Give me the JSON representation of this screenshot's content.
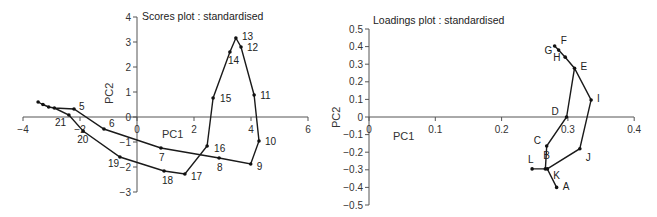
{
  "chart_data": [
    {
      "type": "line",
      "title": "Scores plot : standardised",
      "xlabel": "PC1",
      "ylabel": "PC2",
      "xlim": [
        -4,
        6
      ],
      "ylim": [
        -3,
        4
      ],
      "xticks": [
        -4,
        -2,
        0,
        2,
        4,
        6
      ],
      "yticks": [
        -3,
        -2,
        -1,
        0,
        1,
        2,
        3,
        4
      ],
      "grid": false,
      "series": [
        {
          "name": "scores",
          "points": [
            {
              "label": "1",
              "x": -3.47,
              "y": 0.6,
              "show_label": false
            },
            {
              "label": "2",
              "x": -3.3,
              "y": 0.5,
              "show_label": false
            },
            {
              "label": "3",
              "x": -3.1,
              "y": 0.4,
              "show_label": false
            },
            {
              "label": "4",
              "x": -2.9,
              "y": 0.36,
              "show_label": false
            },
            {
              "label": "5",
              "x": -2.21,
              "y": 0.32,
              "show_label": true
            },
            {
              "label": "6",
              "x": -1.16,
              "y": -0.48,
              "show_label": true
            },
            {
              "label": "7",
              "x": 0.84,
              "y": -1.24,
              "show_label": true
            },
            {
              "label": "8",
              "x": 2.88,
              "y": -1.64,
              "show_label": true
            },
            {
              "label": "9",
              "x": 3.99,
              "y": -1.88,
              "show_label": true
            },
            {
              "label": "10",
              "x": 4.28,
              "y": -0.96,
              "show_label": true
            },
            {
              "label": "11",
              "x": 4.11,
              "y": 0.88,
              "show_label": true
            },
            {
              "label": "12",
              "x": 3.65,
              "y": 2.8,
              "show_label": true
            },
            {
              "label": "13",
              "x": 3.47,
              "y": 3.16,
              "show_label": true
            },
            {
              "label": "14",
              "x": 3.26,
              "y": 2.6,
              "show_label": true
            },
            {
              "label": "15",
              "x": 2.67,
              "y": 0.76,
              "show_label": true
            },
            {
              "label": "16",
              "x": 2.46,
              "y": -1.16,
              "show_label": true
            },
            {
              "label": "17",
              "x": 1.68,
              "y": -2.28,
              "show_label": true
            },
            {
              "label": "18",
              "x": 0.95,
              "y": -2.16,
              "show_label": true
            },
            {
              "label": "19",
              "x": -0.6,
              "y": -1.6,
              "show_label": true
            },
            {
              "label": "20",
              "x": -1.89,
              "y": -0.56,
              "show_label": true
            },
            {
              "label": "21",
              "x": -2.39,
              "y": 0.08,
              "show_label": true
            }
          ]
        }
      ]
    },
    {
      "type": "line",
      "title": "Loadings plot : standardised",
      "xlabel": "PC1",
      "ylabel": "PC2",
      "xlim": [
        0,
        0.4
      ],
      "ylim": [
        -0.5,
        0.5
      ],
      "xticks": [
        0,
        0.1,
        0.2,
        0.3,
        0.4
      ],
      "yticks": [
        -0.5,
        -0.4,
        -0.3,
        -0.2,
        -0.1,
        0,
        0.1,
        0.2,
        0.3,
        0.4,
        0.5
      ],
      "grid": false,
      "series": [
        {
          "name": "loadings",
          "path_order": [
            "A",
            "K",
            "L",
            "K",
            "B",
            "C",
            "D",
            "E",
            "H",
            "G",
            "F",
            "G",
            "H",
            "E",
            "I",
            "J",
            "K"
          ],
          "points": [
            {
              "label": "A",
              "x": 0.283,
              "y": -0.4
            },
            {
              "label": "B",
              "x": 0.266,
              "y": -0.295
            },
            {
              "label": "C",
              "x": 0.268,
              "y": -0.165
            },
            {
              "label": "D",
              "x": 0.298,
              "y": 0.0
            },
            {
              "label": "E",
              "x": 0.31,
              "y": 0.277
            },
            {
              "label": "F",
              "x": 0.28,
              "y": 0.403
            },
            {
              "label": "G",
              "x": 0.286,
              "y": 0.38
            },
            {
              "label": "H",
              "x": 0.296,
              "y": 0.34
            },
            {
              "label": "I",
              "x": 0.335,
              "y": 0.097
            },
            {
              "label": "J",
              "x": 0.318,
              "y": -0.18
            },
            {
              "label": "K",
              "x": 0.269,
              "y": -0.295
            },
            {
              "label": "L",
              "x": 0.246,
              "y": -0.295
            }
          ]
        }
      ]
    }
  ],
  "scores": {
    "title": "Scores plot : standardised",
    "xlabel": "PC1",
    "ylabel": "PC2",
    "xtick_labels": [
      "−4",
      "−2",
      "0",
      "2",
      "4",
      "6"
    ],
    "ytick_labels": [
      "−3",
      "−2",
      "−1",
      "0",
      "1",
      "2",
      "3",
      "4"
    ]
  },
  "loadings": {
    "title": "Loadings plot : standardised",
    "xlabel": "PC1",
    "ylabel": "PC2",
    "xtick_labels": [
      "0",
      "0.1",
      "0.2",
      "0.3",
      "0.4"
    ],
    "ytick_labels": [
      "−0.5",
      "−0.4",
      "−0.3",
      "−0.2",
      "−0.1",
      "0",
      "0.1",
      "0.2",
      "0.3",
      "0.4",
      "0.5"
    ]
  }
}
